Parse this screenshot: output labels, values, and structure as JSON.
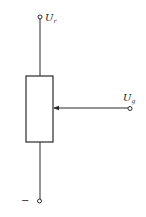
{
  "diagram": {
    "type": "potentiometer-circuit",
    "colors": {
      "stroke": "#2a2a2a",
      "background": "#ffffff"
    },
    "labels": {
      "top_terminal": {
        "main": "U",
        "sub": "r"
      },
      "wiper_terminal": {
        "main": "U",
        "sub": "g"
      },
      "bottom_terminal": "−"
    },
    "components": [
      {
        "id": "resistor",
        "kind": "resistor-rectangle"
      },
      {
        "id": "wiper",
        "kind": "arrow-wiper"
      },
      {
        "id": "top-terminal",
        "kind": "open-terminal"
      },
      {
        "id": "wiper-terminal",
        "kind": "open-terminal"
      },
      {
        "id": "bottom-terminal",
        "kind": "open-terminal"
      }
    ]
  }
}
